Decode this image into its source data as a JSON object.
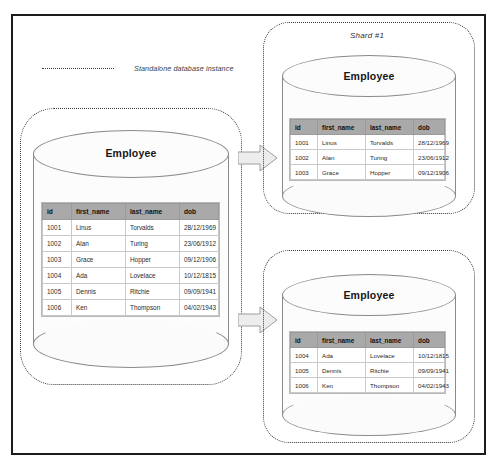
{
  "diagram": {
    "legend": {
      "label": "Standalone database instance",
      "dash_icon": "dotted-line-icon"
    },
    "colors": {
      "frame_border": "#1c1c1c",
      "dotted_border": "#3a3a3a",
      "cylinder_stroke": "#8a8a8a",
      "cylinder_fill": "#fcfcfc",
      "table_header_bg": "#a9a9a9",
      "table_row_bg": "#ffffff",
      "table_border": "#c9c9c9",
      "arrow_fill": "#ededed",
      "arrow_stroke": "#9a9a9a"
    },
    "table_columns": [
      "id",
      "first_name",
      "last_name",
      "dob"
    ],
    "main_instance": {
      "title": "Employee",
      "rows": [
        [
          "1001",
          "Linus",
          "Torvalds",
          "28/12/1969"
        ],
        [
          "1002",
          "Alan",
          "Turing",
          "23/06/1912"
        ],
        [
          "1003",
          "Grace",
          "Hopper",
          "09/12/1906"
        ],
        [
          "1004",
          "Ada",
          "Lovelace",
          "10/12/1815"
        ],
        [
          "1005",
          "Dennis",
          "Ritchie",
          "09/09/1941"
        ],
        [
          "1006",
          "Ken",
          "Thompson",
          "04/02/1943"
        ]
      ]
    },
    "shards": [
      {
        "caption": "Shard #1",
        "title": "Employee",
        "rows": [
          [
            "1001",
            "Linus",
            "Torvalds",
            "28/12/1969"
          ],
          [
            "1002",
            "Alan",
            "Turing",
            "23/06/1912"
          ],
          [
            "1003",
            "Grace",
            "Hopper",
            "09/12/1906"
          ]
        ]
      },
      {
        "caption": "Shard #2",
        "title": "Employee",
        "rows": [
          [
            "1004",
            "Ada",
            "Lovelace",
            "10/12/1815"
          ],
          [
            "1005",
            "Dennis",
            "Ritchie",
            "09/09/1941"
          ],
          [
            "1006",
            "Ken",
            "Thompson",
            "04/02/1943"
          ]
        ]
      }
    ],
    "arrows": [
      {
        "name": "arrow-to-shard-1",
        "direction": "right"
      },
      {
        "name": "arrow-to-shard-2",
        "direction": "right"
      }
    ]
  }
}
